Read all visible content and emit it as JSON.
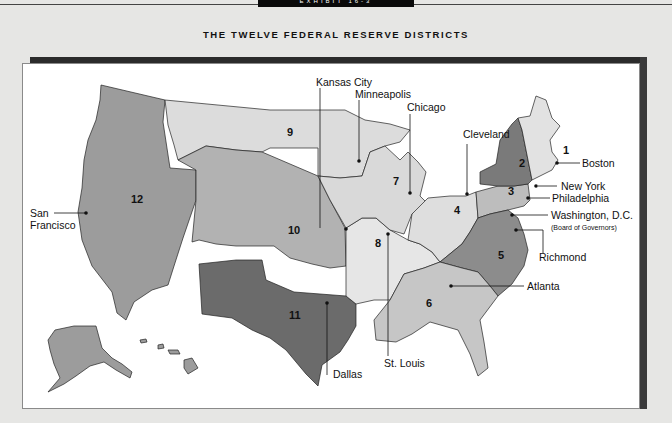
{
  "header": {
    "exhibit_tab": "EXHIBIT 16-3",
    "title": "THE TWELVE FEDERAL RESERVE DISTRICTS"
  },
  "colors": {
    "background": "#e6e6e4",
    "district_1": "#e2e2e2",
    "district_2": "#7a7a7a",
    "district_3": "#bdbdbd",
    "district_4": "#dedede",
    "district_5": "#8c8c8c",
    "district_6": "#c6c6c6",
    "district_7": "#d9d9d9",
    "district_8": "#e6e6e6",
    "district_9": "#dcdcdc",
    "district_10": "#b2b2b2",
    "district_11": "#6b6b6b",
    "district_12": "#9c9c9c"
  },
  "districts": [
    {
      "number": "1",
      "city": "Boston"
    },
    {
      "number": "2",
      "city": "New York"
    },
    {
      "number": "3",
      "city": "Philadelphia"
    },
    {
      "number": "4",
      "city": "Cleveland"
    },
    {
      "number": "5",
      "city": "Richmond"
    },
    {
      "number": "6",
      "city": "Atlanta"
    },
    {
      "number": "7",
      "city": "Chicago"
    },
    {
      "number": "8",
      "city": "St. Louis"
    },
    {
      "number": "9",
      "city": "Minneapolis"
    },
    {
      "number": "10",
      "city": "Kansas City"
    },
    {
      "number": "11",
      "city": "Dallas"
    },
    {
      "number": "12",
      "city": "San Francisco"
    }
  ],
  "labels": {
    "kansas_city": "Kansas City",
    "minneapolis": "Minneapolis",
    "chicago": "Chicago",
    "cleveland": "Cleveland",
    "boston": "Boston",
    "new_york": "New York",
    "philadelphia": "Philadelphia",
    "washington": "Washington, D.C.",
    "washington_sub": "(Board of Governors)",
    "richmond": "Richmond",
    "atlanta": "Atlanta",
    "dallas": "Dallas",
    "st_louis": "St. Louis",
    "san_francisco_1": "San",
    "san_francisco_2": "Francisco"
  }
}
